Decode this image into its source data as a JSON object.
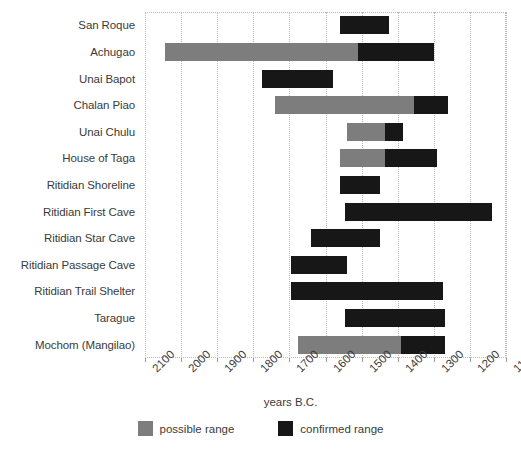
{
  "chart_data": {
    "type": "bar",
    "subtype": "horizontal-range-bar",
    "title": "",
    "xlabel": "years B.C.",
    "ylabel": "",
    "xlim": [
      2100,
      1100
    ],
    "x_axis_direction": "descending",
    "xticks": [
      2100,
      2000,
      1900,
      1800,
      1700,
      1600,
      1500,
      1400,
      1300,
      1200,
      1100
    ],
    "xtick_labels": [
      "2100",
      "2000",
      "1900",
      "1800",
      "1700",
      "1600",
      "1500",
      "1400",
      "1300",
      "1200",
      "1100"
    ],
    "grid": true,
    "grid_style": "dotted vertical",
    "legend_position": "bottom-center",
    "legend": [
      {
        "name": "possible range",
        "color": "#7d7d7d"
      },
      {
        "name": "confirmed range",
        "color": "#171717"
      }
    ],
    "categories": [
      "San Roque",
      "Achugao",
      "Unai Bapot",
      "Chalan Piao",
      "Unai Chulu",
      "House of Taga",
      "Ritidian Shoreline",
      "Ritidian First Cave",
      "Ritidian Star Cave",
      "Ritidian Passage Cave",
      "Ritidian Trail Shelter",
      "Tarague",
      "Mochom (Mangilao)"
    ],
    "series": [
      {
        "name": "possible range",
        "color": "#7d7d7d",
        "ranges": [
          null,
          [
            2045,
            1510
          ],
          null,
          [
            1740,
            1355
          ],
          [
            1540,
            1435
          ],
          [
            1560,
            1435
          ],
          null,
          null,
          null,
          null,
          null,
          null,
          [
            1675,
            1390
          ]
        ]
      },
      {
        "name": "confirmed range",
        "color": "#171717",
        "ranges": [
          [
            1560,
            1425
          ],
          [
            1510,
            1300
          ],
          [
            1775,
            1580
          ],
          [
            1355,
            1260
          ],
          [
            1435,
            1385
          ],
          [
            1435,
            1290
          ],
          [
            1560,
            1450
          ],
          [
            1545,
            1140
          ],
          [
            1640,
            1450
          ],
          [
            1695,
            1540
          ],
          [
            1695,
            1275
          ],
          [
            1545,
            1270
          ],
          [
            1390,
            1270
          ]
        ]
      }
    ]
  }
}
